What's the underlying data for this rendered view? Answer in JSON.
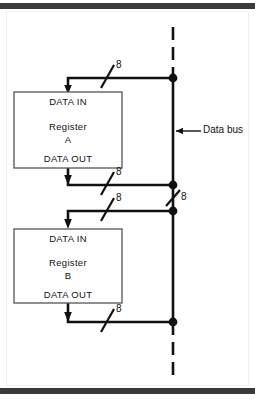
{
  "figure": {
    "background_color": "#ffffff",
    "ink_color": "#111111",
    "band_color": "#3a3a3a",
    "registers": [
      {
        "id": "register-a",
        "data_in_label": "DATA IN",
        "name_label": "Register",
        "designator_label": "A",
        "data_out_label": "DATA OUT",
        "input_width_label": "8",
        "output_width_label": "8"
      },
      {
        "id": "register-b",
        "data_in_label": "DATA IN",
        "name_label": "Register",
        "designator_label": "B",
        "data_out_label": "DATA OUT",
        "input_width_label": "8",
        "output_width_label": "8"
      }
    ],
    "bus": {
      "label": "Data bus",
      "width_label": "8",
      "style": "dashed-ends"
    }
  }
}
